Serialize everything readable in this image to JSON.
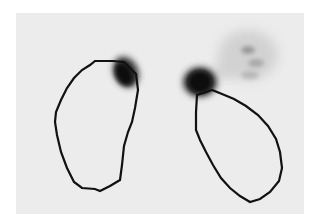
{
  "image": {
    "description": "Grayscale nuclear medicine scan with two hand-drawn region-of-interest outlines and dark uptake spots",
    "background_color": "#ffffff",
    "panel_color": "#ececec",
    "contour_color": "#111111",
    "blob_color": "#0a0a0a"
  },
  "regions": [
    {
      "name": "left-roi",
      "points": "95,61 113,61 124,62 136,74 138,90 135,108 132,122 128,132 124,146 122,165 120,180 110,186 100,191 95,189 82,188 74,182 67,168 61,152 57,135 55,122 56,112 61,100 67,88 74,78 82,70 90,65"
    },
    {
      "name": "right-roi",
      "points": "197,95 196,112 196,130 200,140 206,152 213,165 221,178 230,188 240,196 250,202 260,199 270,192 279,181 282,168 280,152 276,139 268,126 258,115 246,106 234,99 222,94 212,90"
    }
  ],
  "hotspots": [
    {
      "name": "left-hotspot",
      "cx": 124,
      "cy": 74,
      "rx": 10,
      "ry": 14,
      "rotate": -25
    },
    {
      "name": "right-hotspot",
      "cx": 200,
      "cy": 82,
      "rx": 14,
      "ry": 13,
      "rotate": 0
    }
  ]
}
